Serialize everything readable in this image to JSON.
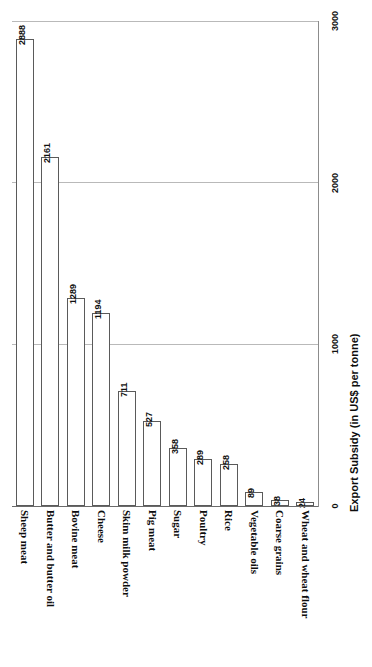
{
  "chart_data": {
    "type": "bar",
    "title": "",
    "subtitle": "",
    "orientation": "vertical-rotated-90",
    "categories": [
      "Sheep meat",
      "Butter and butter oil",
      "Bovine meat",
      "Cheese",
      "Skim milk powder",
      "Pig meat",
      "Sugar",
      "Poultry",
      "Rice",
      "Vegetable oils",
      "Coarse grains",
      "Wheat and wheat flour"
    ],
    "values": [
      2888,
      2161,
      1289,
      1194,
      711,
      527,
      358,
      289,
      258,
      89,
      38,
      24
    ],
    "value_labels": [
      "2888",
      "2161",
      "1289",
      "1194",
      "711",
      "527",
      "358",
      "289",
      "258",
      "89",
      "38",
      "24"
    ],
    "xlabel": "",
    "ylabel": "Export Subsidy (in US$ per tonne)",
    "ylim": [
      0,
      3000
    ],
    "yticks": [
      0,
      1000,
      2000,
      3000
    ],
    "ytick_labels": [
      "0",
      "1000",
      "2000",
      "3000"
    ],
    "grid": true,
    "grid_axis": "y",
    "legend": false,
    "legend_position": "none",
    "colors": {
      "bar_fill": "#ffffff",
      "bar_stroke": "#5a5a5a",
      "gridline": "#b9b9b9",
      "axis": "#6b6b6b",
      "text": "#111111"
    }
  }
}
